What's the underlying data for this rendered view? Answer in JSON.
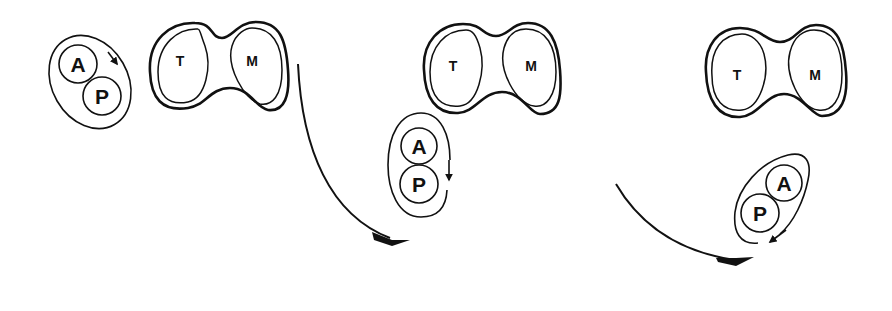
{
  "diagram": {
    "panels": [
      {
        "cell": {
          "left_label": "T",
          "right_label": "M"
        },
        "pair": {
          "top_label": "A",
          "bottom_label": "P"
        }
      },
      {
        "cell": {
          "left_label": "T",
          "right_label": "M"
        },
        "pair": {
          "top_label": "A",
          "bottom_label": "P"
        }
      },
      {
        "cell": {
          "left_label": "T",
          "right_label": "M"
        },
        "pair": {
          "top_label": "A",
          "bottom_label": "P"
        }
      }
    ],
    "colors": {
      "line": "#111111",
      "background": "#ffffff"
    }
  }
}
